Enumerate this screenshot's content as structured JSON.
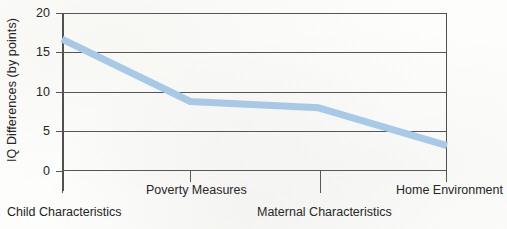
{
  "chart_data": {
    "type": "line",
    "title": "",
    "xlabel": "",
    "ylabel": "IQ Differences (by points)",
    "categories": [
      "Child Characteristics",
      "Poverty Measures",
      "Maternal Characteristics",
      "Home Environment"
    ],
    "values": [
      16.7,
      8.8,
      8.0,
      3.2
    ],
    "series": [
      {
        "name": "IQ Differences",
        "values": [
          16.7,
          8.8,
          8.0,
          3.2
        ]
      }
    ],
    "ylim": [
      0,
      20
    ],
    "yticks": [
      0,
      5,
      10,
      15,
      20
    ],
    "ytick_labels": [
      "0",
      "5",
      "10",
      "15",
      "20"
    ],
    "grid": "horizontal",
    "legend": "none",
    "line_color": "#a9cdec",
    "axis_color": "#4f4f4f",
    "grid_color": "#555555",
    "background_color": "#fdfdfb",
    "label_stagger": [
      "lower",
      "upper",
      "lower",
      "upper"
    ]
  },
  "axis": {
    "y_title": "IQ Differences (by points)",
    "ticks": [
      {
        "label": "20",
        "value": 20
      },
      {
        "label": "15",
        "value": 15
      },
      {
        "label": "10",
        "value": 10
      },
      {
        "label": "5",
        "value": 5
      },
      {
        "label": "0",
        "value": 0
      }
    ]
  },
  "x_labels": [
    {
      "text": "Child Characteristics",
      "row": "lower"
    },
    {
      "text": "Poverty Measures",
      "row": "upper"
    },
    {
      "text": "Maternal Characteristics",
      "row": "lower"
    },
    {
      "text": "Home Environment",
      "row": "upper"
    }
  ]
}
